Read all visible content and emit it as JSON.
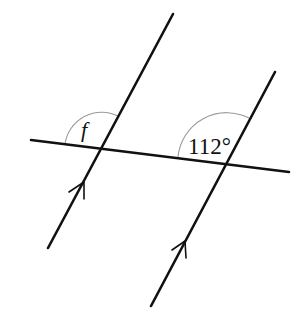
{
  "diagram": {
    "type": "parallel-lines-transversal",
    "colors": {
      "line": "#111111",
      "arc": "#9a9a9a",
      "background": "#ffffff"
    },
    "lines": [
      {
        "id": "parallel-left",
        "x1": 173,
        "y1": 14,
        "x2": 48,
        "y2": 248,
        "has_arrow": true
      },
      {
        "id": "parallel-right",
        "x1": 275,
        "y1": 72,
        "x2": 151,
        "y2": 306,
        "has_arrow": true
      },
      {
        "id": "transversal",
        "x1": 31,
        "y1": 140,
        "x2": 289,
        "y2": 172,
        "has_arrow": false
      }
    ],
    "angles": [
      {
        "id": "angle-f",
        "label": "f",
        "vertex": [
          101,
          148
        ],
        "italic": true
      },
      {
        "id": "angle-112",
        "label": "112°",
        "vertex": [
          225,
          162
        ],
        "value_degrees": 112
      }
    ]
  }
}
